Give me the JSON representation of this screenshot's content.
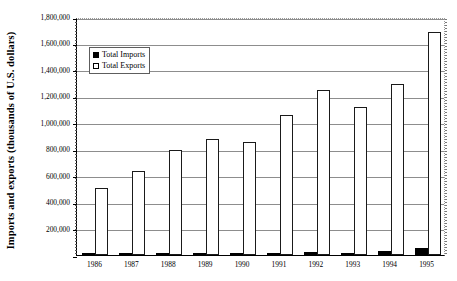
{
  "chart_data": {
    "type": "bar",
    "title": "",
    "xlabel": "",
    "ylabel": "Imports and exports (thousands of U.S. dollars)",
    "categories": [
      "1986",
      "1987",
      "1988",
      "1989",
      "1990",
      "1991",
      "1992",
      "1993",
      "1994",
      "1995"
    ],
    "series": [
      {
        "name": "Total Imports",
        "color": "#000000",
        "values": [
          1500,
          2000,
          3000,
          7000,
          9000,
          10000,
          23000,
          18000,
          33000,
          55000
        ]
      },
      {
        "name": "Total Exports",
        "color": "#ffffff",
        "values": [
          510000,
          635000,
          795000,
          875000,
          855000,
          1060000,
          1245000,
          1120000,
          1295000,
          1690000
        ]
      }
    ],
    "ylim": [
      0,
      1800000
    ],
    "ytick_step": 200000,
    "ytick_labels": [
      "0",
      "200,000",
      "400,000",
      "600,000",
      "800,000",
      "1,000,000",
      "1,200,000",
      "1,400,000",
      "1,600,000",
      "1,800,000"
    ],
    "ytick_values": [
      0,
      200000,
      400000,
      600000,
      800000,
      1000000,
      1200000,
      1400000,
      1600000,
      1800000
    ],
    "grid": true,
    "grid_axis": "y",
    "legend": {
      "position": "top-center-left",
      "entries": [
        {
          "label": "Total Imports",
          "marker": "filled-square",
          "color": "#000000"
        },
        {
          "label": "Total Exports",
          "marker": "open-square",
          "color": "#ffffff"
        }
      ]
    },
    "axis_colors": {
      "spine": "#000000",
      "gridline": "#8d8d8d",
      "frame_dotted": "#9a9a9a"
    }
  }
}
